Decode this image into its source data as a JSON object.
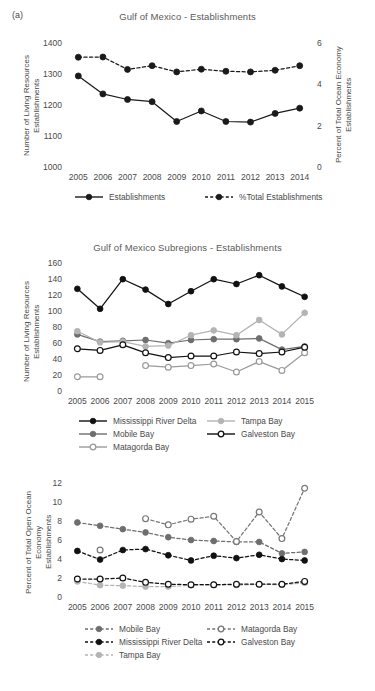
{
  "figure": {
    "panel_tag": "(a)"
  },
  "chart_data": [
    {
      "id": "gulf-of-mexico-establishments",
      "type": "line",
      "title": "Gulf of Mexico - Establishments",
      "xlabel": "",
      "ylabel": "Number of Living Resources\nEstablishments",
      "y2label": "Percent of Total Ocean Economy\nEstablishments",
      "grid": false,
      "legend_position": "bottom",
      "categories": [
        "2005",
        "2006",
        "2007",
        "2008",
        "2009",
        "2010",
        "2011",
        "2012",
        "2013",
        "2014"
      ],
      "yticks": [
        1000,
        1100,
        1200,
        1300,
        1400
      ],
      "ylim": [
        1000,
        1400
      ],
      "y2ticks": [
        0,
        2,
        4,
        6
      ],
      "y2lim": [
        0,
        6
      ],
      "series": [
        {
          "name": "Establishments",
          "axis": "left",
          "style": "solid",
          "color": "#1a1a1a",
          "marker": "filled",
          "values": [
            1297,
            1239,
            1221,
            1214,
            1150,
            1184,
            1150,
            1148,
            1176,
            1193
          ]
        },
        {
          "name": "%Total Establishments",
          "axis": "right",
          "style": "dashed",
          "color": "#1a1a1a",
          "marker": "filled",
          "values": [
            5.36,
            5.37,
            4.77,
            4.95,
            4.65,
            4.78,
            4.68,
            4.65,
            4.73,
            4.95
          ]
        }
      ]
    },
    {
      "id": "gulf-of-mexico-subregions-establishments",
      "type": "line",
      "title": "Gulf of Mexico Subregions - Establishments",
      "xlabel": "",
      "ylabel": "Number of Living Resources Establishments",
      "grid": false,
      "legend_position": "bottom",
      "categories": [
        "2005",
        "2006",
        "2007",
        "2008",
        "2009",
        "2010",
        "2011",
        "2012",
        "2013",
        "2014",
        "2015"
      ],
      "yticks": [
        0,
        20,
        40,
        60,
        80,
        100,
        120,
        140,
        160
      ],
      "ylim": [
        0,
        160
      ],
      "series": [
        {
          "name": "Mississippi River Delta",
          "style": "solid",
          "color": "#111111",
          "marker": "filled",
          "values": [
            129,
            104,
            141,
            128,
            110,
            126,
            141,
            135,
            146,
            132,
            119
          ]
        },
        {
          "name": "Mobile Bay",
          "style": "solid",
          "color": "#6e6e6e",
          "marker": "filled",
          "values": [
            72,
            63,
            64,
            65,
            61,
            65,
            66,
            66,
            67,
            53,
            57
          ]
        },
        {
          "name": "Matagorda Bay",
          "style": "solid",
          "color": "#9a9a9a",
          "marker": "open",
          "values": [
            19,
            19,
            null,
            33,
            31,
            33,
            35,
            25,
            38,
            27,
            49
          ]
        },
        {
          "name": "Tampa Bay",
          "style": "solid",
          "color": "#b4b4b4",
          "marker": "filled",
          "values": [
            76,
            62,
            63,
            57,
            58,
            71,
            77,
            71,
            90,
            72,
            99
          ]
        },
        {
          "name": "Galveston Bay",
          "style": "solid",
          "color": "#111111",
          "marker": "open",
          "values": [
            54,
            52,
            59,
            49,
            43,
            45,
            45,
            50,
            48,
            50,
            56
          ]
        }
      ]
    },
    {
      "id": "gulf-of-mexico-subregions-percent",
      "type": "line",
      "title": "",
      "xlabel": "",
      "ylabel": "Percent of Total Open Ocean Economy\nEstablishments",
      "grid": false,
      "legend_position": "bottom",
      "categories": [
        "2005",
        "2006",
        "2007",
        "2008",
        "2009",
        "2010",
        "2011",
        "2012",
        "2013",
        "2014",
        "2015"
      ],
      "yticks": [
        0,
        2,
        4,
        6,
        8,
        10,
        12
      ],
      "ylim": [
        0,
        12
      ],
      "series": [
        {
          "name": "Mobile Bay",
          "style": "dashed",
          "color": "#6e6e6e",
          "marker": "filled",
          "values": [
            7.95,
            7.6,
            7.25,
            6.9,
            6.4,
            6.1,
            6.0,
            5.9,
            5.9,
            4.7,
            4.85
          ]
        },
        {
          "name": "Mississippi River Delta",
          "style": "dashed",
          "color": "#111111",
          "marker": "filled",
          "values": [
            4.95,
            4.05,
            5.05,
            5.15,
            4.5,
            3.95,
            4.45,
            4.2,
            4.55,
            4.1,
            3.95
          ]
        },
        {
          "name": "Tampa Bay",
          "style": "dashed",
          "color": "#b4b4b4",
          "marker": "filled",
          "values": [
            1.75,
            1.35,
            1.3,
            1.2,
            1.2,
            1.35,
            1.4,
            1.35,
            1.45,
            1.4,
            1.6
          ]
        },
        {
          "name": "Matagorda Bay",
          "style": "dashed",
          "color": "#777777",
          "marker": "open",
          "values": [
            null,
            5.05,
            null,
            8.35,
            7.7,
            8.3,
            8.6,
            5.95,
            9.05,
            6.25,
            11.55
          ]
        },
        {
          "name": "Galveston Bay",
          "style": "dashed",
          "color": "#111111",
          "marker": "open",
          "values": [
            2.0,
            2.0,
            2.1,
            1.65,
            1.45,
            1.4,
            1.4,
            1.45,
            1.45,
            1.45,
            1.75
          ]
        }
      ]
    }
  ]
}
